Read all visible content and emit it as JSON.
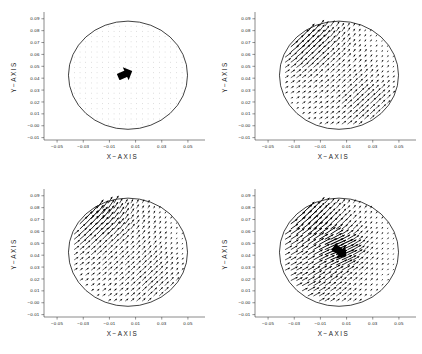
{
  "figure": {
    "width": 422,
    "height": 354,
    "background": "#ffffff",
    "ink_color": "#000000",
    "layout": "2x2 grid of vector-field (quiver) plots"
  },
  "axes_common": {
    "xlabel": "X−AXIS",
    "ylabel": "Y−AXIS",
    "xticks": [
      "−0.05",
      "−0.03",
      "−0.01",
      "0.01",
      "0.03",
      "0.05"
    ],
    "xtick_values": [
      -0.05,
      -0.03,
      -0.01,
      0.01,
      0.03,
      0.05
    ],
    "yticks": [
      "0.09",
      "0.08",
      "0.07",
      "0.06",
      "0.05",
      "0.04",
      "0.03",
      "0.02",
      "0.01",
      "−0.00",
      "−0.01"
    ],
    "ytick_values": [
      0.09,
      0.08,
      0.07,
      0.06,
      0.05,
      0.04,
      0.03,
      0.02,
      0.01,
      -0.0,
      -0.01
    ],
    "xlim": [
      -0.06,
      0.06
    ],
    "ylim": [
      -0.012,
      0.094
    ],
    "grid": false,
    "legend": null,
    "boundary_shape": "circle",
    "boundary_center": [
      0.0042,
      0.0425
    ],
    "boundary_radius": 0.0455
  },
  "chart_data": [
    {
      "type": "scatter",
      "plot_kind": "quiver",
      "panel_index": 0,
      "panel_position": "top-left",
      "title": "",
      "xlabel": "X−AXIS",
      "ylabel": "Y−AXIS",
      "xlim": [
        -0.06,
        0.06
      ],
      "ylim": [
        -0.012,
        0.094
      ],
      "grid": false,
      "field": {
        "grid_nx": 22,
        "grid_ny": 22,
        "pattern": "dipole",
        "focus": [
          0.0005,
          0.0425
        ],
        "focus_strength": 0.006,
        "second_focus": [
          -0.004,
          0.016
        ],
        "second_strength": 0.003,
        "axis_angle_deg": 45,
        "base_magnitude": 0.1,
        "blob": {
          "cx": 0.0015,
          "cy": 0.0432,
          "length": 0.0105,
          "width": 0.0052,
          "angle_deg": 24
        }
      }
    },
    {
      "type": "scatter",
      "plot_kind": "quiver",
      "panel_index": 1,
      "panel_position": "top-right",
      "title": "",
      "xlabel": "X−AXIS",
      "ylabel": "Y−AXIS",
      "xlim": [
        -0.06,
        0.06
      ],
      "ylim": [
        -0.012,
        0.094
      ],
      "grid": false,
      "field": {
        "grid_nx": 22,
        "grid_ny": 22,
        "pattern": "diagonal-shear",
        "strong_corner": "upper-left",
        "second_corner": "lower-right",
        "corner_strength": 1.0,
        "second_strength": 0.88,
        "flow_angle_deg": 45,
        "base_magnitude": 0.34,
        "blob": null
      }
    },
    {
      "type": "scatter",
      "plot_kind": "quiver",
      "panel_index": 2,
      "panel_position": "bottom-left",
      "title": "",
      "xlabel": "X−AXIS",
      "ylabel": "Y−AXIS",
      "xlim": [
        -0.06,
        0.06
      ],
      "ylim": [
        -0.012,
        0.094
      ],
      "grid": false,
      "field": {
        "grid_nx": 22,
        "grid_ny": 22,
        "pattern": "corner-jet",
        "strong_corner": "upper-left",
        "second_corner": "lower-right",
        "corner_strength": 1.0,
        "second_strength": 0.62,
        "flow_angle_deg": 48,
        "base_magnitude": 0.4,
        "blob": null
      }
    },
    {
      "type": "scatter",
      "plot_kind": "quiver",
      "panel_index": 3,
      "panel_position": "bottom-right",
      "title": "",
      "xlabel": "X−AXIS",
      "ylabel": "Y−AXIS",
      "xlim": [
        -0.06,
        0.06
      ],
      "ylim": [
        -0.012,
        0.094
      ],
      "grid": false,
      "field": {
        "grid_nx": 22,
        "grid_ny": 22,
        "pattern": "corner-jet-with-core",
        "strong_corner": "upper-left",
        "second_corner": "lower-left",
        "corner_strength": 1.0,
        "second_strength": 0.55,
        "flow_angle_deg": 42,
        "base_magnitude": 0.42,
        "blob": {
          "cx": 0.0045,
          "cy": 0.0435,
          "length": 0.011,
          "width": 0.0058,
          "angle_deg": -35
        }
      }
    }
  ]
}
